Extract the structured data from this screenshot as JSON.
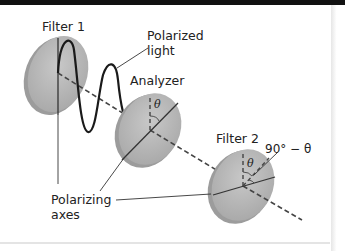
{
  "diagram": {
    "labels": {
      "filter1": "Filter 1",
      "polarized_light_line1": "Polarized",
      "polarized_light_line2": "light",
      "analyzer": "Analyzer",
      "filter2": "Filter 2",
      "angle_complement": "90° − θ",
      "theta_analyzer": "θ",
      "theta_filter2": "θ",
      "polarizing_axes_line1": "Polarizing",
      "polarizing_axes_line2": "axes"
    },
    "colors": {
      "filter_fill": "#b4b4b4",
      "filter_edge": "#9a9a9a",
      "line": "#222222",
      "top_bar": "#111111"
    }
  }
}
